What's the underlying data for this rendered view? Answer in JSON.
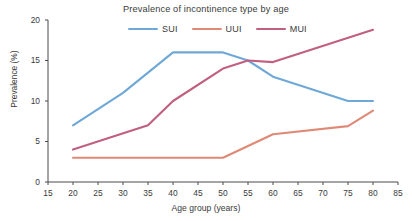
{
  "chart_data": {
    "type": "line",
    "title": "Prevalence of incontinence type by age",
    "xlabel": "Age group (years)",
    "ylabel": "Prevalence (%)",
    "xlim": [
      15,
      85
    ],
    "ylim": [
      0,
      20
    ],
    "xticks": [
      15,
      20,
      25,
      30,
      35,
      40,
      45,
      50,
      55,
      60,
      65,
      70,
      75,
      80,
      85
    ],
    "yticks": [
      0,
      5,
      10,
      15,
      20
    ],
    "grid": false,
    "legend_position": "top-center",
    "series": [
      {
        "name": "SUI",
        "color": "#6fa8d6",
        "x": [
          20,
          30,
          40,
          50,
          55,
          60,
          75,
          80
        ],
        "values": [
          7.0,
          11.0,
          16.0,
          16.0,
          15.0,
          13.0,
          10.0,
          10.0
        ]
      },
      {
        "name": "UUI",
        "color": "#de8a77",
        "x": [
          20,
          50,
          60,
          75,
          80
        ],
        "values": [
          3.0,
          3.0,
          5.9,
          6.9,
          8.8
        ]
      },
      {
        "name": "MUI",
        "color": "#c0607e",
        "x": [
          20,
          35,
          40,
          50,
          55,
          60,
          80
        ],
        "values": [
          4.0,
          7.0,
          10.0,
          14.0,
          15.0,
          14.8,
          18.8
        ]
      }
    ]
  },
  "axes": {
    "axis_color": "#4a4a4a",
    "tick_color": "#4a4a4a"
  }
}
